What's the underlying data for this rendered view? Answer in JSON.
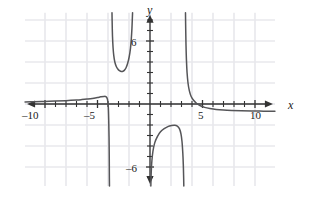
{
  "figure": {
    "title": "",
    "kind": "cartesian-graph"
  },
  "axes": {
    "x_label": "x",
    "y_label": "y",
    "x_tick_labels": [
      {
        "value": -10,
        "text": "–10"
      },
      {
        "value": -5,
        "text": "–5"
      },
      {
        "value": 5,
        "text": "5"
      },
      {
        "value": 10,
        "text": "10"
      }
    ],
    "y_tick_labels": [
      {
        "value": 6,
        "text": "6"
      },
      {
        "value": -6,
        "text": "–6"
      }
    ],
    "x_range": [
      -11.9,
      11.9
    ],
    "y_range": [
      -7.8,
      8.7
    ],
    "grid": true,
    "grid_step": 2,
    "tick_step": 1,
    "axis_color": "#333333",
    "grid_color": "#e8e8ec",
    "curve_color": "#555558"
  },
  "chart_data": {
    "type": "line",
    "title": "",
    "xlabel": "x",
    "ylabel": "y",
    "xlim": [
      -11.9,
      11.9
    ],
    "ylim": [
      -7.8,
      8.7
    ],
    "grid": true,
    "legend": "none",
    "asymptotes": {
      "vertical": [
        -3.85,
        3.35
      ],
      "horizontal": [
        0
      ]
    },
    "series": [
      {
        "name": "left-branch",
        "comment": "approaches y=0 from above on far left, drops to minus infinity at x=-3.85",
        "points": [
          [
            -11.9,
            0.2
          ],
          [
            -11.0,
            0.22
          ],
          [
            -10.0,
            0.25
          ],
          [
            -9.0,
            0.28
          ],
          [
            -8.0,
            0.32
          ],
          [
            -7.0,
            0.38
          ],
          [
            -6.5,
            0.42
          ],
          [
            -6.0,
            0.47
          ],
          [
            -5.5,
            0.53
          ],
          [
            -5.0,
            0.62
          ],
          [
            -4.7,
            0.68
          ],
          [
            -4.4,
            0.72
          ],
          [
            -4.2,
            0.7
          ],
          [
            -4.05,
            0.45
          ],
          [
            -3.97,
            -0.3
          ],
          [
            -3.93,
            -1.6
          ],
          [
            -3.9,
            -3.2
          ],
          [
            -3.88,
            -5.2
          ],
          [
            -3.87,
            -7.0
          ],
          [
            -3.86,
            -7.8
          ]
        ]
      },
      {
        "name": "upper-u-branch",
        "comment": "U shaped branch above the x-axis between x=-3.85 and x=-1.2",
        "points": [
          [
            -3.62,
            8.7
          ],
          [
            -3.6,
            7.6
          ],
          [
            -3.57,
            6.4
          ],
          [
            -3.52,
            5.4
          ],
          [
            -3.45,
            4.6
          ],
          [
            -3.35,
            4.0
          ],
          [
            -3.2,
            3.55
          ],
          [
            -3.0,
            3.25
          ],
          [
            -2.8,
            3.12
          ],
          [
            -2.62,
            3.1
          ],
          [
            -2.45,
            3.2
          ],
          [
            -2.28,
            3.45
          ],
          [
            -2.12,
            3.9
          ],
          [
            -1.98,
            4.5
          ],
          [
            -1.86,
            5.3
          ],
          [
            -1.78,
            6.2
          ],
          [
            -1.72,
            7.2
          ],
          [
            -1.68,
            8.2
          ],
          [
            -1.66,
            8.7
          ]
        ]
      },
      {
        "name": "right-upper-branch",
        "comment": "comes down from plus infinity at x=3.35 and flattens toward y=0 going right",
        "points": [
          [
            3.38,
            8.7
          ],
          [
            3.4,
            7.2
          ],
          [
            3.43,
            5.6
          ],
          [
            3.47,
            4.2
          ],
          [
            3.53,
            3.0
          ],
          [
            3.62,
            2.0
          ],
          [
            3.75,
            1.25
          ],
          [
            3.92,
            0.72
          ],
          [
            4.15,
            0.35
          ],
          [
            4.45,
            0.05
          ],
          [
            4.8,
            -0.17
          ],
          [
            5.2,
            -0.32
          ],
          [
            5.7,
            -0.43
          ],
          [
            6.3,
            -0.52
          ],
          [
            7.0,
            -0.58
          ],
          [
            7.8,
            -0.62
          ],
          [
            8.7,
            -0.65
          ],
          [
            9.7,
            -0.67
          ],
          [
            10.8,
            -0.68
          ],
          [
            11.9,
            -0.69
          ]
        ]
      },
      {
        "name": "lower-arch-branch",
        "comment": "inverted-U branch below the x-axis between x=0 and x=3.35",
        "points": [
          [
            0.08,
            -7.8
          ],
          [
            0.1,
            -7.0
          ],
          [
            0.13,
            -6.2
          ],
          [
            0.18,
            -5.4
          ],
          [
            0.28,
            -4.5
          ],
          [
            0.45,
            -3.7
          ],
          [
            0.7,
            -3.1
          ],
          [
            1.0,
            -2.65
          ],
          [
            1.35,
            -2.35
          ],
          [
            1.7,
            -2.15
          ],
          [
            2.05,
            -2.05
          ],
          [
            2.35,
            -2.02
          ],
          [
            2.6,
            -2.1
          ],
          [
            2.8,
            -2.35
          ],
          [
            2.95,
            -2.85
          ],
          [
            3.05,
            -3.6
          ],
          [
            3.12,
            -4.6
          ],
          [
            3.17,
            -5.7
          ],
          [
            3.2,
            -6.8
          ],
          [
            3.22,
            -7.8
          ]
        ]
      }
    ]
  }
}
